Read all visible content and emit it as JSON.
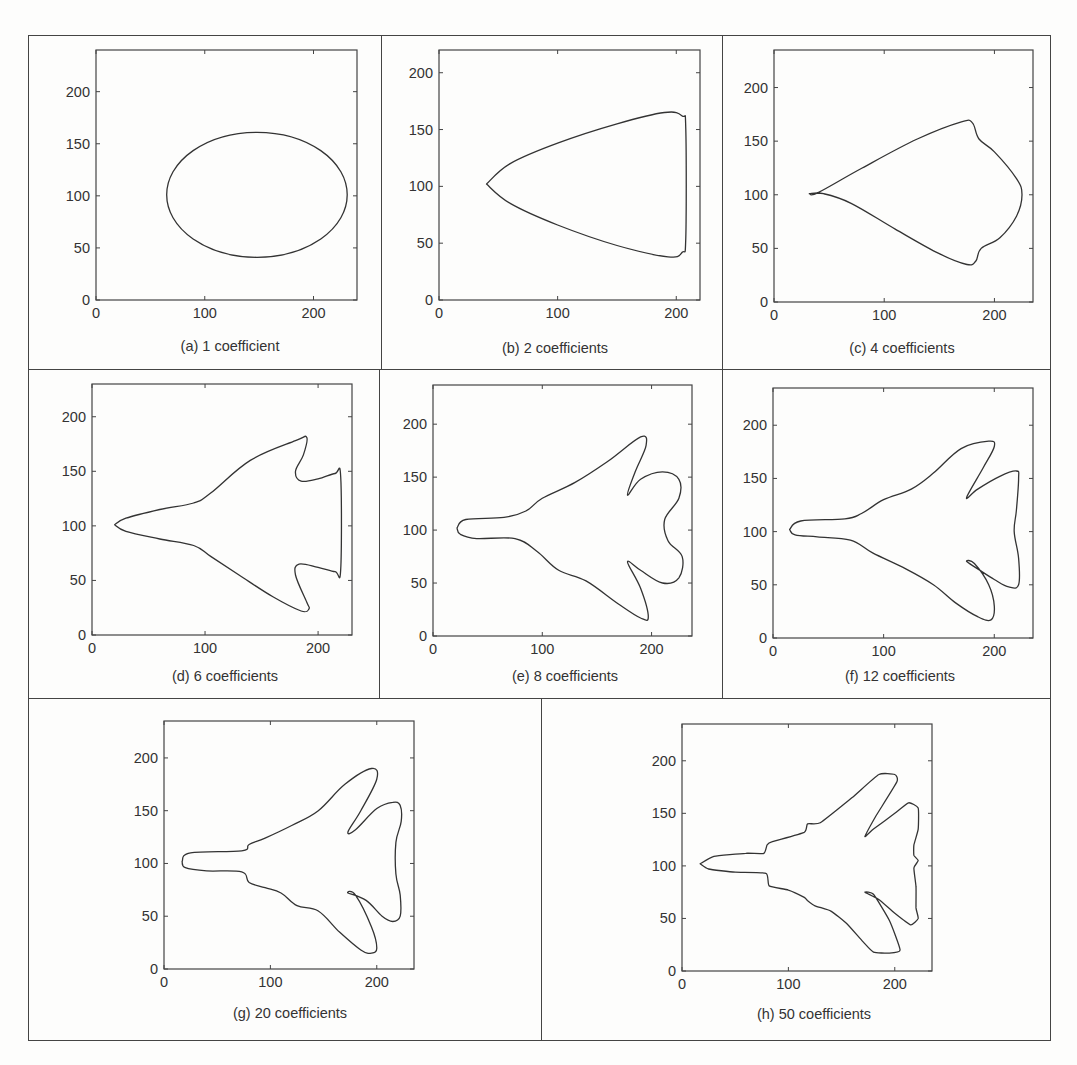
{
  "figure": {
    "panels": [
      {
        "id": "a",
        "caption": "(a) 1 coefficient"
      },
      {
        "id": "b",
        "caption": "(b) 2 coefficients"
      },
      {
        "id": "c",
        "caption": "(c) 4 coefficients"
      },
      {
        "id": "d",
        "caption": "(d) 6 coefficients"
      },
      {
        "id": "e",
        "caption": "(e) 8 coefficients"
      },
      {
        "id": "f",
        "caption": "(f) 12 coefficients"
      },
      {
        "id": "g",
        "caption": "(g) 20 coefficients"
      },
      {
        "id": "h",
        "caption": "(h) 50 coefficients"
      }
    ]
  },
  "chart_data": [
    {
      "type": "line",
      "title": "(a) 1 coefficient",
      "xticks": [
        0,
        100,
        200
      ],
      "yticks": [
        0,
        50,
        100,
        150,
        200
      ],
      "xlim": [
        0,
        240
      ],
      "ylim": [
        0,
        240
      ],
      "shape": "ellipse",
      "center": [
        148,
        101
      ],
      "rx": 83,
      "ry": 60
    },
    {
      "type": "line",
      "title": "(b) 2 coefficients",
      "xticks": [
        0,
        100,
        200
      ],
      "yticks": [
        0,
        50,
        100,
        150,
        200
      ],
      "xlim": [
        0,
        220
      ],
      "ylim": [
        0,
        220
      ],
      "points": [
        [
          40,
          102
        ],
        [
          60,
          120
        ],
        [
          100,
          138
        ],
        [
          150,
          155
        ],
        [
          190,
          165
        ],
        [
          205,
          162
        ],
        [
          208,
          150
        ],
        [
          208,
          55
        ],
        [
          205,
          42
        ],
        [
          193,
          38
        ],
        [
          150,
          48
        ],
        [
          100,
          66
        ],
        [
          60,
          85
        ],
        [
          40,
          102
        ]
      ]
    },
    {
      "type": "line",
      "title": "(c) 4 coefficients",
      "xticks": [
        0,
        100,
        200
      ],
      "yticks": [
        0,
        50,
        100,
        150,
        200
      ],
      "xlim": [
        0,
        235
      ],
      "ylim": [
        0,
        235
      ],
      "points": [
        [
          32,
          101
        ],
        [
          40,
          102
        ],
        [
          80,
          125
        ],
        [
          130,
          152
        ],
        [
          170,
          168
        ],
        [
          180,
          167
        ],
        [
          186,
          152
        ],
        [
          200,
          140
        ],
        [
          220,
          115
        ],
        [
          225,
          100
        ],
        [
          220,
          80
        ],
        [
          205,
          60
        ],
        [
          188,
          50
        ],
        [
          183,
          38
        ],
        [
          175,
          35
        ],
        [
          150,
          45
        ],
        [
          110,
          68
        ],
        [
          70,
          92
        ],
        [
          45,
          101
        ],
        [
          32,
          101
        ]
      ]
    },
    {
      "type": "line",
      "title": "(d) 6 coefficients",
      "xticks": [
        0,
        100,
        200
      ],
      "yticks": [
        0,
        50,
        100,
        150,
        200
      ],
      "xlim": [
        0,
        230
      ],
      "ylim": [
        0,
        230
      ],
      "points": [
        [
          20,
          101
        ],
        [
          30,
          107
        ],
        [
          60,
          115
        ],
        [
          90,
          121
        ],
        [
          105,
          130
        ],
        [
          140,
          160
        ],
        [
          180,
          178
        ],
        [
          190,
          181
        ],
        [
          187,
          165
        ],
        [
          180,
          150
        ],
        [
          185,
          141
        ],
        [
          200,
          143
        ],
        [
          215,
          148
        ],
        [
          220,
          145
        ],
        [
          220,
          60
        ],
        [
          215,
          58
        ],
        [
          200,
          62
        ],
        [
          183,
          65
        ],
        [
          180,
          55
        ],
        [
          190,
          30
        ],
        [
          192,
          24
        ],
        [
          185,
          22
        ],
        [
          160,
          35
        ],
        [
          130,
          55
        ],
        [
          105,
          72
        ],
        [
          90,
          82
        ],
        [
          60,
          88
        ],
        [
          30,
          95
        ],
        [
          20,
          101
        ]
      ]
    },
    {
      "type": "line",
      "title": "(e) 8 coefficients",
      "xticks": [
        0,
        100,
        200
      ],
      "yticks": [
        0,
        50,
        100,
        150,
        200
      ],
      "xlim": [
        0,
        237
      ],
      "ylim": [
        0,
        237
      ],
      "points": [
        [
          22,
          102
        ],
        [
          30,
          110
        ],
        [
          65,
          112
        ],
        [
          85,
          118
        ],
        [
          100,
          130
        ],
        [
          130,
          145
        ],
        [
          160,
          165
        ],
        [
          190,
          188
        ],
        [
          195,
          180
        ],
        [
          185,
          155
        ],
        [
          178,
          133
        ],
        [
          190,
          148
        ],
        [
          210,
          155
        ],
        [
          225,
          148
        ],
        [
          225,
          130
        ],
        [
          212,
          110
        ],
        [
          215,
          90
        ],
        [
          228,
          75
        ],
        [
          225,
          55
        ],
        [
          210,
          50
        ],
        [
          190,
          62
        ],
        [
          178,
          70
        ],
        [
          190,
          45
        ],
        [
          197,
          18
        ],
        [
          190,
          17
        ],
        [
          170,
          30
        ],
        [
          140,
          52
        ],
        [
          115,
          62
        ],
        [
          95,
          80
        ],
        [
          75,
          92
        ],
        [
          40,
          92
        ],
        [
          25,
          96
        ],
        [
          22,
          102
        ]
      ]
    },
    {
      "type": "line",
      "title": "(f) 12 coefficients",
      "xticks": [
        0,
        100,
        200
      ],
      "yticks": [
        0,
        50,
        100,
        150,
        200
      ],
      "xlim": [
        0,
        235
      ],
      "ylim": [
        0,
        235
      ],
      "points": [
        [
          15,
          102
        ],
        [
          25,
          110
        ],
        [
          65,
          112
        ],
        [
          80,
          117
        ],
        [
          100,
          130
        ],
        [
          125,
          140
        ],
        [
          145,
          155
        ],
        [
          170,
          178
        ],
        [
          195,
          185
        ],
        [
          200,
          180
        ],
        [
          190,
          160
        ],
        [
          175,
          132
        ],
        [
          185,
          140
        ],
        [
          205,
          152
        ],
        [
          220,
          157
        ],
        [
          222,
          150
        ],
        [
          220,
          120
        ],
        [
          218,
          100
        ],
        [
          222,
          75
        ],
        [
          222,
          50
        ],
        [
          213,
          48
        ],
        [
          200,
          55
        ],
        [
          185,
          65
        ],
        [
          175,
          72
        ],
        [
          182,
          70
        ],
        [
          195,
          50
        ],
        [
          200,
          30
        ],
        [
          197,
          17
        ],
        [
          185,
          20
        ],
        [
          165,
          33
        ],
        [
          145,
          50
        ],
        [
          120,
          65
        ],
        [
          90,
          80
        ],
        [
          70,
          92
        ],
        [
          40,
          95
        ],
        [
          20,
          97
        ],
        [
          15,
          102
        ]
      ]
    },
    {
      "type": "line",
      "title": "(g) 20 coefficients",
      "xticks": [
        0,
        100,
        200
      ],
      "yticks": [
        0,
        50,
        100,
        150,
        200
      ],
      "xlim": [
        0,
        235
      ],
      "ylim": [
        0,
        235
      ],
      "points": [
        [
          17,
          102
        ],
        [
          25,
          110
        ],
        [
          73,
          112
        ],
        [
          80,
          118
        ],
        [
          95,
          124
        ],
        [
          120,
          136
        ],
        [
          145,
          150
        ],
        [
          170,
          175
        ],
        [
          195,
          190
        ],
        [
          200,
          180
        ],
        [
          185,
          150
        ],
        [
          173,
          130
        ],
        [
          180,
          132
        ],
        [
          200,
          152
        ],
        [
          215,
          158
        ],
        [
          222,
          155
        ],
        [
          223,
          140
        ],
        [
          218,
          120
        ],
        [
          218,
          90
        ],
        [
          222,
          70
        ],
        [
          222,
          50
        ],
        [
          215,
          45
        ],
        [
          205,
          50
        ],
        [
          190,
          65
        ],
        [
          173,
          72
        ],
        [
          180,
          70
        ],
        [
          195,
          40
        ],
        [
          200,
          20
        ],
        [
          195,
          15
        ],
        [
          185,
          18
        ],
        [
          165,
          35
        ],
        [
          145,
          55
        ],
        [
          125,
          60
        ],
        [
          110,
          72
        ],
        [
          95,
          77
        ],
        [
          80,
          82
        ],
        [
          73,
          92
        ],
        [
          40,
          93
        ],
        [
          20,
          96
        ],
        [
          17,
          102
        ]
      ]
    },
    {
      "type": "line",
      "title": "(h) 50 coefficients",
      "xticks": [
        0,
        100,
        200
      ],
      "yticks": [
        0,
        50,
        100,
        150,
        200
      ],
      "xlim": [
        0,
        235
      ],
      "ylim": [
        0,
        235
      ],
      "points": [
        [
          17,
          102
        ],
        [
          30,
          109
        ],
        [
          60,
          112
        ],
        [
          77,
          112
        ],
        [
          80,
          120
        ],
        [
          85,
          123
        ],
        [
          115,
          132
        ],
        [
          118,
          140
        ],
        [
          130,
          141
        ],
        [
          160,
          165
        ],
        [
          185,
          187
        ],
        [
          200,
          187
        ],
        [
          202,
          180
        ],
        [
          182,
          147
        ],
        [
          172,
          128
        ],
        [
          180,
          135
        ],
        [
          200,
          150
        ],
        [
          213,
          160
        ],
        [
          222,
          155
        ],
        [
          222,
          135
        ],
        [
          218,
          120
        ],
        [
          218,
          110
        ],
        [
          222,
          105
        ],
        [
          218,
          98
        ],
        [
          220,
          80
        ],
        [
          220,
          60
        ],
        [
          222,
          50
        ],
        [
          215,
          44
        ],
        [
          200,
          55
        ],
        [
          185,
          68
        ],
        [
          172,
          75
        ],
        [
          180,
          73
        ],
        [
          195,
          48
        ],
        [
          205,
          20
        ],
        [
          195,
          17
        ],
        [
          180,
          18
        ],
        [
          170,
          28
        ],
        [
          155,
          45
        ],
        [
          140,
          57
        ],
        [
          125,
          62
        ],
        [
          118,
          67
        ],
        [
          115,
          70
        ],
        [
          100,
          77
        ],
        [
          82,
          81
        ],
        [
          79,
          93
        ],
        [
          50,
          94
        ],
        [
          25,
          97
        ],
        [
          17,
          102
        ]
      ]
    }
  ]
}
